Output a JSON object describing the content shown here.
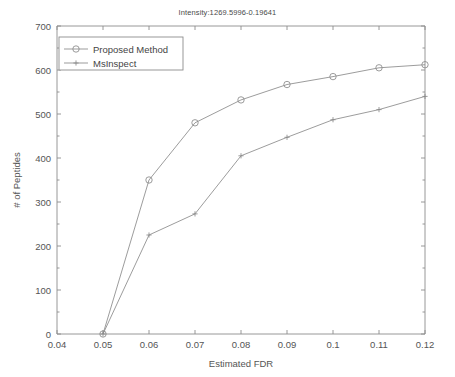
{
  "chart_data": {
    "type": "line",
    "title": "Intensity:1269.5996-0.19641",
    "xlabel": "Estimated FDR",
    "ylabel": "# of Peptides",
    "x": [
      0.05,
      0.06,
      0.07,
      0.08,
      0.09,
      0.1,
      0.11,
      0.12
    ],
    "series": [
      {
        "name": "Proposed Method",
        "marker": "circle",
        "color": "#8a8a8a",
        "values": [
          0,
          350,
          480,
          532,
          567,
          585,
          605,
          612
        ]
      },
      {
        "name": "MsInspect",
        "marker": "plus",
        "color": "#8a8a8a",
        "values": [
          0,
          225,
          273,
          405,
          447,
          487,
          510,
          540
        ]
      }
    ],
    "xlim": [
      0.04,
      0.12
    ],
    "ylim": [
      0,
      700
    ],
    "xticks": [
      0.04,
      0.05,
      0.06,
      0.07,
      0.08,
      0.09,
      0.1,
      0.11,
      0.12
    ],
    "xtick_labels": [
      "0.04",
      "0.05",
      "0.06",
      "0.07",
      "0.08",
      "0.09",
      "0.1",
      "0.11",
      "0.12"
    ],
    "yticks": [
      0,
      100,
      200,
      300,
      400,
      500,
      600,
      700
    ],
    "ytick_labels": [
      "0",
      "100",
      "200",
      "300",
      "400",
      "500",
      "600",
      "700"
    ],
    "grid": false,
    "legend_position": "upper-left"
  },
  "legend": {
    "entries": [
      {
        "label": "Proposed Method"
      },
      {
        "label": "MsInspect"
      }
    ]
  },
  "axes": {
    "x_title": "Estimated FDR",
    "y_title": "# of Peptides"
  },
  "title": "Intensity:1269.5996-0.19641"
}
